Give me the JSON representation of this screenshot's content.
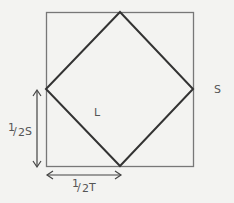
{
  "diagram": {
    "outer_square": {
      "label": "S",
      "stroke": "#777777"
    },
    "inner_diamond": {
      "label": "L",
      "stroke": "#333333"
    },
    "vertical_dimension": {
      "label": "½ S",
      "numerator": "1",
      "denominator": "2",
      "var": "S"
    },
    "horizontal_dimension": {
      "label": "½ T",
      "numerator": "1",
      "denominator": "2",
      "var": "T"
    },
    "background": "#f3f3f1"
  }
}
